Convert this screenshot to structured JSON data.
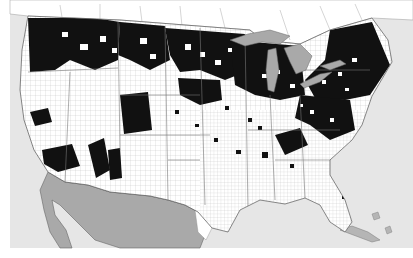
{
  "map": {
    "type": "county-distribution-map",
    "region": "Contiguous United States with southern Canada and northern Mexico",
    "legend": {
      "present": {
        "label": "",
        "color": "#111111"
      },
      "absent": {
        "label": "",
        "color": "#ffffff"
      }
    },
    "colors": {
      "ocean": "#e6e6e6",
      "land_us": "#ffffff",
      "county_border": "#b9b9b9",
      "mexico": "#a9a9a9",
      "great_lakes": "#a9a9a9",
      "canada": "#ffffff",
      "occupied_county": "#111111"
    },
    "occupied_regions": [
      {
        "name": "Pacific Northwest (WA, OR, ID)",
        "shape": "M28,18 L95,18 L120,22 L118,60 L95,70 L70,60 L55,70 L30,72 Z"
      },
      {
        "name": "Montana / northern Rockies",
        "shape": "M120,22 L165,26 L170,60 L150,70 L130,60 L118,55 Z"
      },
      {
        "name": "Northern Great Plains (ND/SD/MN)",
        "shape": "M165,28 L245,34 L250,70 L225,80 L200,70 L180,72 L170,55 Z"
      },
      {
        "name": "Upper Midwest (WI, MI, MN east)",
        "shape": "M230,40 L300,46 L305,95 L280,100 L255,95 L235,85 Z"
      },
      {
        "name": "Northeast (NY, New England, PA)",
        "shape": "M330,30 L372,22 L390,65 L370,95 L345,100 L315,98 L305,80 L325,60 Z"
      },
      {
        "name": "Ohio Valley / Mid-Atlantic",
        "shape": "M300,95 L350,100 L355,130 L330,140 L310,125 L295,118 Z"
      },
      {
        "name": "Northern California",
        "shape": "M30,112 L48,108 L52,122 L35,126 Z"
      },
      {
        "name": "Southern California",
        "shape": "M42,150 L72,144 L80,166 L58,172 L44,164 Z"
      },
      {
        "name": "Nevada / Utah",
        "shape": "M88,145 L104,138 L110,170 L96,178 Z"
      },
      {
        "name": "Colorado",
        "shape": "M120,95 L148,92 L152,130 L124,134 Z"
      },
      {
        "name": "New Mexico / Arizona pockets",
        "shape": "M108,150 L120,148 L122,178 L110,180 Z"
      },
      {
        "name": "Central Plains (NE/KS)",
        "shape": "M178,78 L220,80 L222,100 L200,105 L180,95 Z"
      },
      {
        "name": "Southern Appalachia",
        "shape": "M275,135 L300,128 L308,145 L285,155 Z"
      }
    ],
    "water_bodies": [
      "Lake Superior",
      "Lake Michigan",
      "Lake Huron",
      "Lake Erie",
      "Lake Ontario",
      "Gulf of Mexico",
      "Pacific Ocean",
      "Atlantic Ocean"
    ],
    "text_labels": []
  }
}
